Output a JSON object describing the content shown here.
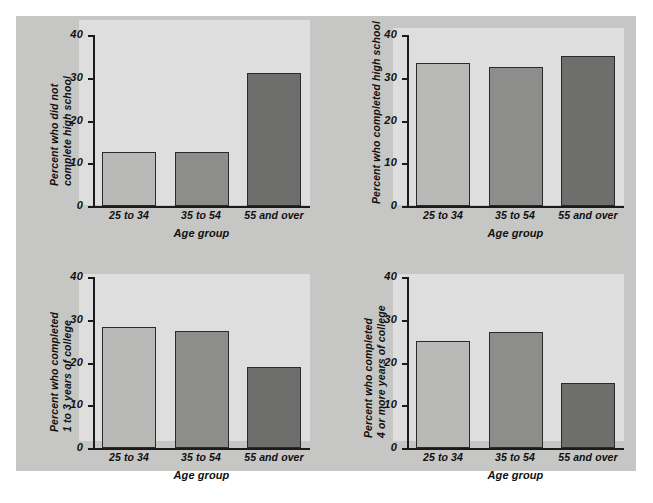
{
  "figure": {
    "background_color": "#c6c6c4",
    "plot_background_color": "#dedede",
    "page_background_color": "#ffffff",
    "axis_color": "#1b1b1b"
  },
  "shared": {
    "categories": [
      "25 to 34",
      "35 to 54",
      "55 and over"
    ],
    "xlabel": "Age group",
    "yticks": [
      "0",
      "10",
      "20",
      "30",
      "40"
    ],
    "ytick_values": [
      0,
      10,
      20,
      30,
      40
    ],
    "bar_colors": [
      "#b9b9b7",
      "#8d8d8b",
      "#6e6e6c"
    ]
  },
  "chart_data": [
    {
      "type": "bar",
      "id": "panel-0",
      "title": "",
      "ylabel": "Percent who did not\ncomplete high school",
      "ylabel_line1": "Percent who did not",
      "ylabel_line2": "complete high school",
      "xlabel": "Age group",
      "categories": [
        "25 to 34",
        "35 to 54",
        "55 and over"
      ],
      "values": [
        12.7,
        12.7,
        31.1
      ],
      "colors": [
        "#b9b9b7",
        "#8d8d8b",
        "#6e6e6c"
      ],
      "ylim": [
        0,
        40
      ],
      "yticks": [
        0,
        10,
        20,
        30,
        40
      ],
      "grid": false,
      "legend": "none"
    },
    {
      "type": "bar",
      "id": "panel-1",
      "title": "",
      "ylabel": "Percent who completed high school",
      "ylabel_line1": "Percent who completed high school",
      "ylabel_line2": "",
      "xlabel": "Age group",
      "categories": [
        "25 to 34",
        "35 to 54",
        "55 and over"
      ],
      "values": [
        33.5,
        32.6,
        35.0
      ],
      "colors": [
        "#b9b9b7",
        "#8d8d8b",
        "#6e6e6c"
      ],
      "ylim": [
        0,
        40
      ],
      "yticks": [
        0,
        10,
        20,
        30,
        40
      ],
      "grid": false,
      "legend": "none"
    },
    {
      "type": "bar",
      "id": "panel-2",
      "title": "",
      "ylabel": "Percent who completed\n1 to 3 years of college",
      "ylabel_line1": "Percent who completed",
      "ylabel_line2": "1 to 3 years of college",
      "xlabel": "Age group",
      "categories": [
        "25 to 34",
        "35 to 54",
        "55 and over"
      ],
      "values": [
        28.2,
        27.3,
        19.0
      ],
      "colors": [
        "#b9b9b7",
        "#8d8d8b",
        "#6e6e6c"
      ],
      "ylim": [
        0,
        40
      ],
      "yticks": [
        0,
        10,
        20,
        30,
        40
      ],
      "grid": false,
      "legend": "none"
    },
    {
      "type": "bar",
      "id": "panel-3",
      "title": "",
      "ylabel": "Percent who completed\n4 or more years of college",
      "ylabel_line1": "Percent who completed",
      "ylabel_line2": "4 or more years of college",
      "xlabel": "Age group",
      "categories": [
        "25 to 34",
        "35 to 54",
        "55 and over"
      ],
      "values": [
        25.0,
        27.1,
        15.3
      ],
      "colors": [
        "#b9b9b7",
        "#8d8d8b",
        "#6e6e6c"
      ],
      "ylim": [
        0,
        40
      ],
      "yticks": [
        0,
        10,
        20,
        30,
        40
      ],
      "grid": false,
      "legend": "none"
    }
  ]
}
